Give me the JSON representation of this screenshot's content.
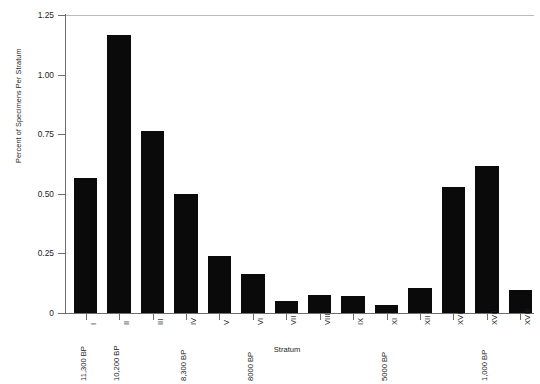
{
  "chart_data": {
    "type": "bar",
    "title": "",
    "xlabel": "Stratum",
    "ylabel": "Percent of Specimens Per Stratum",
    "categories": [
      "I",
      "II",
      "III",
      "IV",
      "V",
      "VI",
      "VII",
      "VIII",
      "IX",
      "XI",
      "XII",
      "XVI",
      "XVII",
      "XVIII"
    ],
    "values": [
      0.565,
      1.165,
      0.765,
      0.5,
      0.24,
      0.165,
      0.05,
      0.075,
      0.07,
      0.035,
      0.105,
      0.53,
      0.615,
      0.095
    ],
    "ylim": [
      0,
      1.25
    ],
    "ytick_labels": [
      "0",
      "0.25",
      "0.50",
      "0.75",
      "1.00",
      "1.25"
    ],
    "ytick_values": [
      0,
      0.25,
      0.5,
      0.75,
      1.0,
      1.25
    ],
    "grid": false,
    "legend": "none",
    "bar_color": "#0a0a0a",
    "axis_color": "#6e6e6e",
    "date_annotations": [
      {
        "label": "11,300 BP",
        "category": "I"
      },
      {
        "label": "10,200 BP",
        "category": "II"
      },
      {
        "label": "8,300 BP",
        "category": "IV"
      },
      {
        "label": "8000 BP",
        "category": "VI"
      },
      {
        "label": "5000 BP",
        "category": "XI"
      },
      {
        "label": "1,000 BP",
        "category": "XVII"
      }
    ]
  }
}
